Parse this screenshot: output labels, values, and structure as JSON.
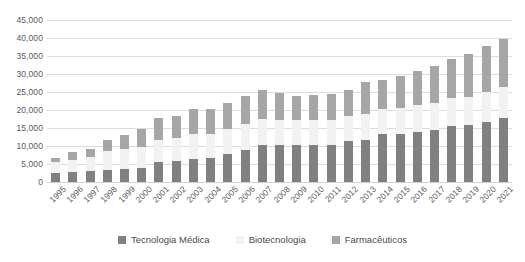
{
  "chart_data": {
    "type": "bar",
    "stacked": true,
    "title": "",
    "subtitle": "",
    "xlabel": "",
    "ylabel": "",
    "ylim": [
      0,
      45000
    ],
    "ytick_interval": 5000,
    "grid": true,
    "legend_position": "bottom",
    "ytick_labels": [
      "45,000",
      "40,000",
      "35,000",
      "30,000",
      "25,000",
      "20,000",
      "15,000",
      "10,000",
      "5,000",
      "0"
    ],
    "ytick_values": [
      45000,
      40000,
      35000,
      30000,
      25000,
      20000,
      15000,
      10000,
      5000,
      0
    ],
    "categories": [
      "1995",
      "1996",
      "1997",
      "1998",
      "1999",
      "2000",
      "2001",
      "2002",
      "2003",
      "2004",
      "2005",
      "2006",
      "2007",
      "2008",
      "2009",
      "2010",
      "2011",
      "2012",
      "2013",
      "2014",
      "2015",
      "2016",
      "2017",
      "2018",
      "2019",
      "2020",
      "2021"
    ],
    "series": [
      {
        "name": "Tecnologia Médica",
        "color": "#808080",
        "values": [
          2400,
          2700,
          3000,
          3400,
          3700,
          3800,
          5600,
          5700,
          6500,
          6600,
          7700,
          8800,
          10200,
          10300,
          10200,
          10300,
          10400,
          11400,
          11800,
          13300,
          13400,
          14000,
          14400,
          15500,
          15800,
          16700,
          17800
        ]
      },
      {
        "name": "Biotecnologia",
        "color": "#f2f2f2",
        "values": [
          3100,
          3500,
          3900,
          5200,
          5600,
          5900,
          6100,
          6400,
          6800,
          6800,
          7000,
          7200,
          7300,
          7000,
          6900,
          6800,
          6900,
          6900,
          7100,
          7100,
          7300,
          7400,
          7600,
          7700,
          7900,
          8300,
          8700
        ]
      },
      {
        "name": "Farmacêuticos",
        "color": "#a6a6a6",
        "values": [
          1300,
          2100,
          2300,
          3000,
          3700,
          4900,
          6100,
          6200,
          7100,
          7000,
          7200,
          7800,
          8200,
          7500,
          6900,
          7100,
          7100,
          7200,
          8800,
          8000,
          8800,
          9500,
          10200,
          11000,
          11900,
          12900,
          13300
        ]
      }
    ]
  },
  "legend": {
    "items": [
      {
        "label": "Tecnologia Médica",
        "color": "#808080"
      },
      {
        "label": "Biotecnologia",
        "color": "#f2f2f2"
      },
      {
        "label": "Farmacêuticos",
        "color": "#a6a6a6"
      }
    ]
  }
}
